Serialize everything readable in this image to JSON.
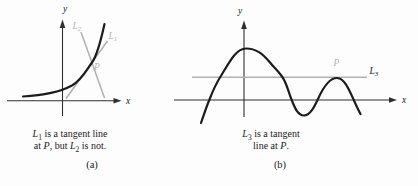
{
  "figure": {
    "panel_a": {
      "axis": {
        "x_label": "x",
        "y_label": "y"
      },
      "labels": {
        "l1": {
          "base": "L",
          "sub": "1"
        },
        "l2": {
          "base": "L",
          "sub": "2"
        },
        "p": "P"
      },
      "caption": {
        "line1": {
          "var": "L",
          "sub": "1",
          "rest": " is a tangent line"
        },
        "line2": {
          "pre": "at ",
          "p": "P",
          "mid": ", but ",
          "var": "L",
          "sub": "2",
          "post": " is not."
        }
      },
      "tag": "(a)"
    },
    "panel_b": {
      "axis": {
        "x_label": "x",
        "y_label": "y"
      },
      "labels": {
        "l3": {
          "base": "L",
          "sub": "3"
        },
        "p": "P"
      },
      "caption": {
        "line1": {
          "var": "L",
          "sub": "3",
          "rest": " is a tangent"
        },
        "line2": {
          "pre": "line at ",
          "p": "P",
          "post": "."
        }
      },
      "tag": "(b)"
    },
    "colors": {
      "curve": "#1c1c1c",
      "axis": "#2e2e2e",
      "tangent_gray": "#b0b0b0",
      "label_gray": "#b3b3b3",
      "text": "#1a1a1a",
      "background": "#fdfdfd"
    }
  }
}
